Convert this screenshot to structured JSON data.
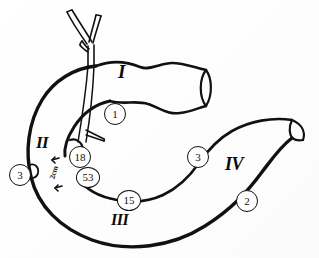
{
  "figure": {
    "background_color": "#fdfdfd",
    "ink_color": "#111111",
    "parts": [
      {
        "id": "part-1",
        "label": "I",
        "name": "superior-part",
        "x": 118,
        "y": 70,
        "size": 19
      },
      {
        "id": "part-2",
        "label": "II",
        "name": "descending-part",
        "x": 36,
        "y": 142,
        "size": 17
      },
      {
        "id": "part-3",
        "label": "III",
        "name": "horizontal-part",
        "x": 111,
        "y": 219,
        "size": 16
      },
      {
        "id": "part-4",
        "label": "IV",
        "name": "ascending-part",
        "x": 225,
        "y": 163,
        "size": 18
      }
    ],
    "callouts": [
      {
        "id": "callout-1",
        "label": "1",
        "x": 104,
        "y": 103
      },
      {
        "id": "callout-18",
        "label": "18",
        "x": 69,
        "y": 146
      },
      {
        "id": "callout-53",
        "label": "53",
        "x": 76,
        "y": 167
      },
      {
        "id": "callout-3a",
        "label": "3",
        "x": 9,
        "y": 164
      },
      {
        "id": "callout-15",
        "label": "15",
        "x": 117,
        "y": 190
      },
      {
        "id": "callout-3b",
        "label": "3",
        "x": 187,
        "y": 146
      },
      {
        "id": "callout-2",
        "label": "2",
        "x": 236,
        "y": 190
      }
    ],
    "scale": {
      "label": "2cm",
      "x": 53,
      "y": 170
    }
  }
}
